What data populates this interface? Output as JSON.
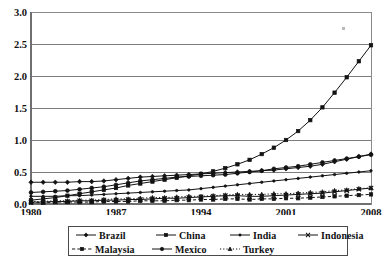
{
  "chart_data": {
    "type": "line",
    "title": "",
    "xlabel": "",
    "ylabel": "",
    "x": [
      1980,
      1981,
      1982,
      1983,
      1984,
      1985,
      1986,
      1987,
      1988,
      1989,
      1990,
      1991,
      1992,
      1993,
      1994,
      1995,
      1996,
      1997,
      1998,
      1999,
      2000,
      2001,
      2002,
      2003,
      2004,
      2005,
      2006,
      2007,
      2008
    ],
    "xlim": [
      1980,
      2008
    ],
    "ylim": [
      0.0,
      3.0
    ],
    "ytick_values": [
      0.0,
      0.5,
      1.0,
      1.5,
      2.0,
      2.5,
      3.0
    ],
    "ytick_labels": [
      "0.0",
      "0.5",
      "1.0",
      "1.5",
      "2.0",
      "2.5",
      "3.0"
    ],
    "xtick_values": [
      1980,
      1987,
      1994,
      2001,
      2008
    ],
    "xtick_labels": [
      "1980",
      "1987",
      "1994",
      "2001",
      "2008"
    ],
    "grid": "horizontal",
    "legend_position": "below-axis",
    "series": [
      {
        "name": "Brazil",
        "marker": "diamond",
        "linestyle": "solid",
        "values": [
          0.34,
          0.34,
          0.34,
          0.34,
          0.35,
          0.35,
          0.36,
          0.38,
          0.4,
          0.42,
          0.43,
          0.44,
          0.45,
          0.46,
          0.47,
          0.48,
          0.49,
          0.5,
          0.51,
          0.52,
          0.53,
          0.55,
          0.57,
          0.59,
          0.62,
          0.66,
          0.7,
          0.74,
          0.78
        ]
      },
      {
        "name": "China",
        "marker": "square",
        "linestyle": "solid",
        "values": [
          0.06,
          0.08,
          0.1,
          0.13,
          0.16,
          0.19,
          0.22,
          0.25,
          0.29,
          0.32,
          0.35,
          0.38,
          0.41,
          0.44,
          0.47,
          0.51,
          0.56,
          0.62,
          0.69,
          0.78,
          0.88,
          1.0,
          1.14,
          1.31,
          1.51,
          1.74,
          1.98,
          2.23,
          2.48
        ]
      },
      {
        "name": "India",
        "marker": "dot",
        "linestyle": "solid",
        "values": [
          0.12,
          0.12,
          0.12,
          0.13,
          0.13,
          0.14,
          0.15,
          0.16,
          0.17,
          0.18,
          0.19,
          0.2,
          0.21,
          0.22,
          0.24,
          0.26,
          0.28,
          0.3,
          0.32,
          0.34,
          0.36,
          0.38,
          0.4,
          0.42,
          0.44,
          0.46,
          0.48,
          0.5,
          0.52
        ]
      },
      {
        "name": "Indonesia",
        "marker": "cross",
        "linestyle": "solid",
        "values": [
          0.03,
          0.03,
          0.04,
          0.04,
          0.05,
          0.05,
          0.06,
          0.06,
          0.07,
          0.07,
          0.08,
          0.09,
          0.09,
          0.1,
          0.11,
          0.12,
          0.13,
          0.13,
          0.12,
          0.12,
          0.13,
          0.14,
          0.15,
          0.16,
          0.17,
          0.19,
          0.21,
          0.23,
          0.25
        ]
      },
      {
        "name": "Malaysia",
        "marker": "square",
        "linestyle": "dashed",
        "values": [
          0.02,
          0.02,
          0.03,
          0.03,
          0.03,
          0.03,
          0.04,
          0.04,
          0.04,
          0.05,
          0.05,
          0.05,
          0.06,
          0.06,
          0.07,
          0.07,
          0.08,
          0.08,
          0.07,
          0.08,
          0.08,
          0.09,
          0.09,
          0.1,
          0.11,
          0.12,
          0.13,
          0.14,
          0.15
        ]
      },
      {
        "name": "Mexico",
        "marker": "circle",
        "linestyle": "solid",
        "values": [
          0.18,
          0.19,
          0.2,
          0.21,
          0.23,
          0.25,
          0.27,
          0.3,
          0.33,
          0.36,
          0.38,
          0.4,
          0.42,
          0.43,
          0.44,
          0.45,
          0.46,
          0.48,
          0.5,
          0.52,
          0.55,
          0.57,
          0.59,
          0.62,
          0.65,
          0.68,
          0.71,
          0.74,
          0.77
        ]
      },
      {
        "name": "Turkey",
        "marker": "triangle",
        "linestyle": "dotted",
        "values": [
          0.04,
          0.04,
          0.05,
          0.05,
          0.06,
          0.06,
          0.07,
          0.08,
          0.08,
          0.09,
          0.1,
          0.1,
          0.11,
          0.12,
          0.12,
          0.13,
          0.14,
          0.15,
          0.15,
          0.15,
          0.16,
          0.16,
          0.17,
          0.18,
          0.19,
          0.21,
          0.22,
          0.24,
          0.25
        ]
      }
    ]
  },
  "legend": {
    "rows": [
      [
        {
          "label": "Brazil",
          "marker": "diamond",
          "linestyle": "solid"
        },
        {
          "label": "China",
          "marker": "square",
          "linestyle": "solid"
        },
        {
          "label": "India",
          "marker": "dot",
          "linestyle": "solid"
        },
        {
          "label": "Indonesia",
          "marker": "cross",
          "linestyle": "solid"
        }
      ],
      [
        {
          "label": "Malaysia",
          "marker": "square",
          "linestyle": "dashed"
        },
        {
          "label": "Mexico",
          "marker": "circle",
          "linestyle": "solid"
        },
        {
          "label": "Turkey",
          "marker": "triangle",
          "linestyle": "dotted"
        }
      ]
    ]
  },
  "colors": {
    "ink": "#121212",
    "grid": "#7d7d7d",
    "border": "#8a8a8a",
    "background": "#ffffff"
  }
}
